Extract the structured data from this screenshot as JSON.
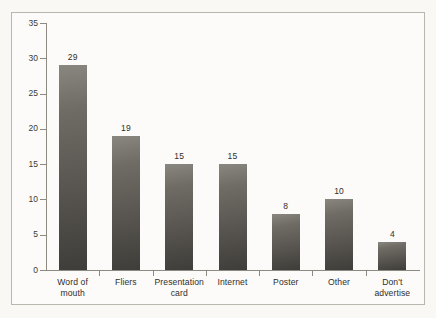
{
  "chart_data": {
    "type": "bar",
    "title": "",
    "subtitle": "",
    "xlabel": "",
    "ylabel": "",
    "categories": [
      "Word of mouth",
      "Fliers",
      "Presentation card",
      "Internet",
      "Poster",
      "Other",
      "Don't advertise"
    ],
    "category_lines": [
      [
        "Word of",
        "mouth"
      ],
      [
        "Fliers"
      ],
      [
        "Presentation",
        "card"
      ],
      [
        "Internet"
      ],
      [
        "Poster"
      ],
      [
        "Other"
      ],
      [
        "Don't advertise"
      ]
    ],
    "values": [
      29,
      19,
      15,
      15,
      8,
      10,
      4
    ],
    "data_labels": [
      "29",
      "19",
      "15",
      "15",
      "8",
      "10",
      "4"
    ],
    "ylim": [
      0,
      35
    ],
    "ytick_values": [
      0,
      5,
      10,
      15,
      20,
      25,
      30,
      35
    ],
    "ytick_labels": [
      "0",
      "5",
      "10",
      "15",
      "20",
      "25",
      "30",
      "35"
    ],
    "grid": false,
    "legend": null,
    "legend_position": "none",
    "bar_color": "#5a5752",
    "axis_color": "#8d8a82",
    "background_color": "#fcfbf9",
    "frame_color": "#b9b6ad",
    "text_color": "#2f2e2b"
  }
}
